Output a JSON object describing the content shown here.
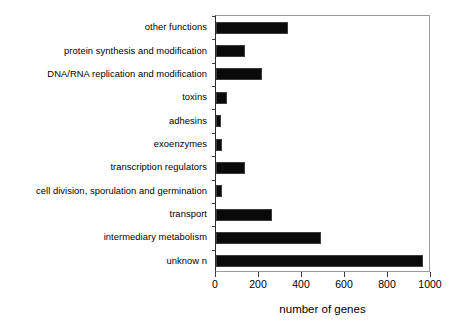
{
  "chart_data": {
    "type": "bar",
    "orientation": "horizontal",
    "title": "",
    "xlabel": "number of genes",
    "ylabel": "",
    "xlim": [
      0,
      1000
    ],
    "xticks": [
      0,
      200,
      400,
      600,
      800,
      1000
    ],
    "xtick_labels": [
      "0",
      "200",
      "400",
      "600",
      "800",
      "1000"
    ],
    "grid": false,
    "legend": null,
    "bar_color": "#000000",
    "background_color": "#ffffff",
    "categories": [
      "other functions",
      "protein synthesis and modification",
      "DNA/RNA replication and modification",
      "toxins",
      "adhesins",
      "exoenzymes",
      "transcription regulators",
      "cell division, sporulation and germination",
      "transport",
      "intermediary metabolism",
      "unknow n"
    ],
    "values": [
      335,
      135,
      215,
      50,
      25,
      30,
      135,
      30,
      260,
      490,
      965
    ]
  }
}
